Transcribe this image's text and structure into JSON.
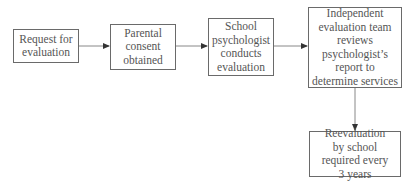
{
  "diagram": {
    "type": "flowchart",
    "nodes": [
      {
        "id": "request",
        "label": "Request for evaluation"
      },
      {
        "id": "consent",
        "label": "Parental consent obtained"
      },
      {
        "id": "psych",
        "label": "School psychologist conducts evaluation"
      },
      {
        "id": "team",
        "label": "Independent evaluation team reviews psychologist’s report to determine services"
      },
      {
        "id": "reeval",
        "label": "Reevaluation by school required every 3 years"
      }
    ],
    "edges": [
      {
        "from": "request",
        "to": "consent"
      },
      {
        "from": "consent",
        "to": "psych"
      },
      {
        "from": "psych",
        "to": "team"
      },
      {
        "from": "team",
        "to": "reeval"
      }
    ],
    "colors": {
      "border": "#6a6a6a",
      "text": "#555555",
      "arrow": "#777777"
    }
  }
}
